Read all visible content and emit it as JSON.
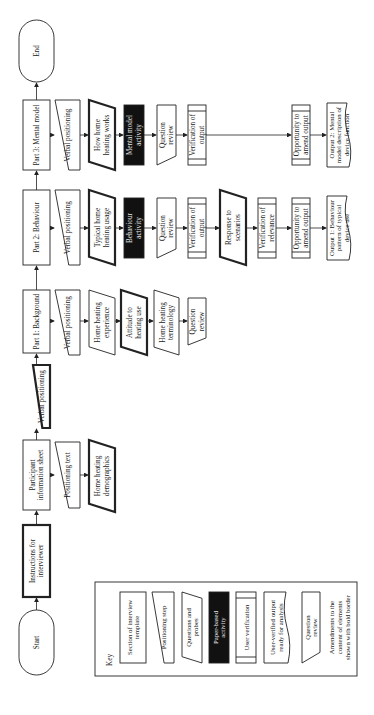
{
  "diagram": {
    "start": "Start",
    "end": "End",
    "instructions": [
      "Instructions for",
      "interviewer"
    ],
    "participant_info": [
      "Participant",
      "information sheet"
    ],
    "positioning_text": "Positioning text",
    "home_heating_demographics": [
      "Home heating",
      "demographics"
    ],
    "verbal_positioning_main": "Verbal positioning",
    "part1": {
      "title": "Part 1: Background",
      "verbal": "Verbal positioning",
      "experience": [
        "Home heating",
        "experience"
      ],
      "attitude": [
        "Attitude to",
        "heating use"
      ],
      "terminology": [
        "Home heating",
        "terminology"
      ],
      "review": [
        "Question",
        "review"
      ]
    },
    "part2": {
      "title": "Part 2: Behaviour",
      "verbal": "Verbal positioning",
      "usage": [
        "Typical home",
        "heating usage"
      ],
      "activity": [
        "Behaviour",
        "activity"
      ],
      "review": [
        "Question",
        "review"
      ],
      "verification": [
        "Verification of",
        "output"
      ],
      "scenarios": [
        "Response to",
        "scenarios"
      ],
      "relevance": [
        "Verification of",
        "relevance"
      ],
      "amend": [
        "Opportunity to",
        "amend output"
      ],
      "output": [
        "Output 1: Behaviour",
        "pattern of typical",
        "device use"
      ]
    },
    "part3": {
      "title": "Part 3: Mental model",
      "verbal": "Verbal positioning",
      "works": [
        "How home",
        "heating works"
      ],
      "activity": [
        "Mental model",
        "activity"
      ],
      "review": [
        "Question",
        "review"
      ],
      "verification": [
        "Verification of",
        "output"
      ],
      "amend": [
        "Opportunity to",
        "amend output"
      ],
      "output": [
        "Output 2: Mental",
        "model description of",
        "device function"
      ]
    },
    "key": {
      "title": "Key",
      "items": [
        [
          "Section of interview",
          "template"
        ],
        [
          "Positioning step"
        ],
        [
          "Questions and",
          "probes"
        ],
        [
          "Paper-based",
          "activity"
        ],
        [
          "User verification"
        ],
        [
          "User-verified output",
          "ready for analysis"
        ],
        [
          "Question",
          "review"
        ],
        [
          "Amendments to the",
          "content of elements",
          "shown with bold border"
        ]
      ]
    }
  }
}
